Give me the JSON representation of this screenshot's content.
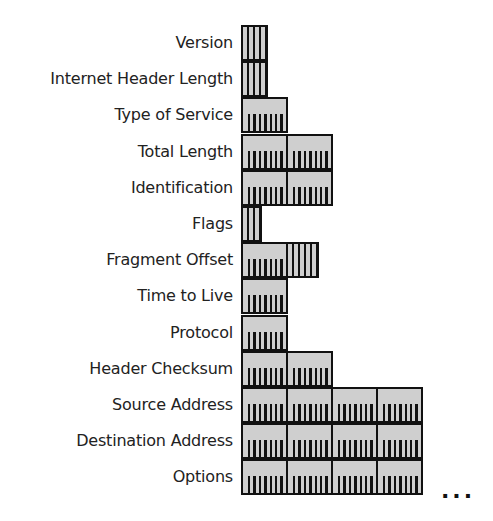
{
  "bit_width_px": 6,
  "byte_width_px": 47,
  "colors": {
    "fill": "#cfcfcf",
    "line": "#111111",
    "text": "#222222"
  },
  "fields": [
    {
      "label": "Version",
      "bits": 4
    },
    {
      "label": "Internet Header Length",
      "bits": 4
    },
    {
      "label": "Type of Service",
      "bits": 8
    },
    {
      "label": "Total Length",
      "bits": 16
    },
    {
      "label": "Identification",
      "bits": 16
    },
    {
      "label": "Flags",
      "bits": 3
    },
    {
      "label": "Fragment Offset",
      "bits": 13
    },
    {
      "label": "Time to Live",
      "bits": 8
    },
    {
      "label": "Protocol",
      "bits": 8
    },
    {
      "label": "Header Checksum",
      "bits": 16
    },
    {
      "label": "Source Address",
      "bits": 32
    },
    {
      "label": "Destination Address",
      "bits": 32
    },
    {
      "label": "Options",
      "bits": 32
    }
  ],
  "continuation": "..."
}
